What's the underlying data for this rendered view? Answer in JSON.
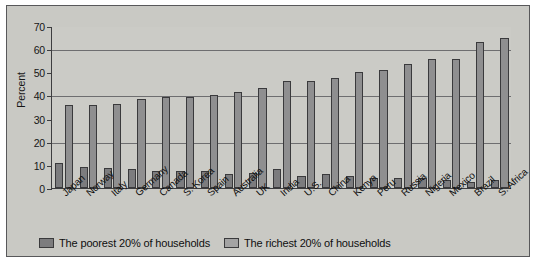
{
  "chart_data": {
    "type": "bar",
    "title": "",
    "xlabel": "",
    "ylabel": "Percent",
    "ylim": [
      0,
      70
    ],
    "yticks": [
      0,
      10,
      20,
      30,
      40,
      50,
      60,
      70
    ],
    "gridlines": [
      20,
      40,
      60
    ],
    "grid": true,
    "legend_position": "bottom",
    "categories": [
      "Japan",
      "Norway",
      "Italy",
      "Germany",
      "Canada",
      "S. Korea",
      "Spain",
      "Australia",
      "UK",
      "India",
      "U.S.",
      "China",
      "Kenya",
      "Peru",
      "Russia",
      "Nigeria",
      "Mexico",
      "Brazil",
      "S. Africa"
    ],
    "series": [
      {
        "name": "The poorest 20% of households",
        "color": "#7c7c7e",
        "values": [
          10.6,
          9.2,
          8.7,
          8.2,
          7.5,
          7.4,
          7.5,
          5.9,
          6.6,
          8.1,
          5.2,
          5.9,
          5.0,
          4.4,
          4.4,
          4.4,
          3.6,
          2.5,
          3.3
        ]
      },
      {
        "name": "The richest 20% of households",
        "color": "#8f8f90",
        "values": [
          35.7,
          35.8,
          36.3,
          38.5,
          39.3,
          39.3,
          40.3,
          41.3,
          43.2,
          46.1,
          46.4,
          47.5,
          50.2,
          51.2,
          53.7,
          55.7,
          55.9,
          63.0,
          64.8
        ]
      }
    ]
  },
  "legend": {
    "items": [
      {
        "label": "The poorest 20% of households",
        "swatch": "poor"
      },
      {
        "label": "The richest 20% of households",
        "swatch": "rich"
      }
    ]
  },
  "colors": {
    "panel_background": "#c9c9c4",
    "panel_border": "#58585a",
    "axis": "#3d3d3f",
    "gridline": "#6e6e70",
    "bar_poorest": "#7c7c7e",
    "bar_richest": "#8f8f90",
    "text": "#101010"
  }
}
